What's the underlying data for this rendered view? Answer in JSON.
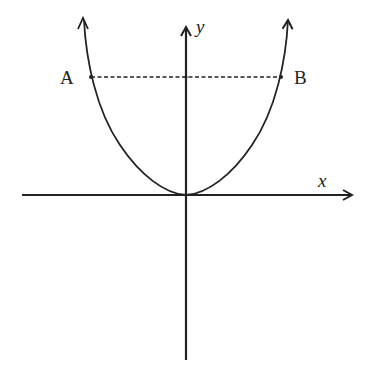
{
  "diagram": {
    "type": "graph-sketch",
    "labels": {
      "y_axis": "y",
      "x_axis": "x",
      "point_a": "A",
      "point_b": "B"
    },
    "colors": {
      "stroke": "#222222",
      "background": "#ffffff"
    }
  }
}
